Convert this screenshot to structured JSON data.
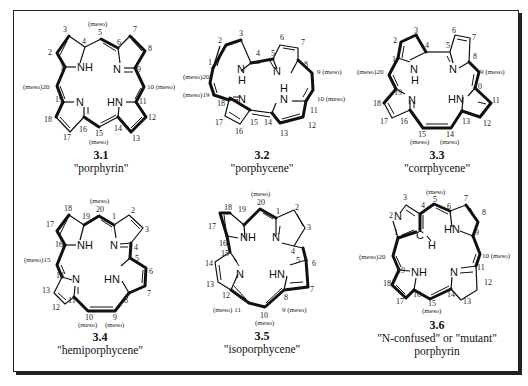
{
  "figure": {
    "compounds": [
      {
        "id": "3.1",
        "name": "\"porphyrin\"",
        "labels": {
          "c1": "1",
          "c2": "2",
          "c3": "3",
          "c4": "4",
          "c5": "5",
          "c6": "6",
          "c7": "7",
          "c8": "8",
          "c9": "9",
          "c10": "10 (meso)",
          "c11": "11",
          "c12": "12",
          "c13": "13",
          "c14": "14",
          "c15": "15",
          "c16": "16",
          "c17": "17",
          "c18": "18",
          "c19": "19",
          "c20": "(meso)20",
          "meso_top": "(meso)",
          "meso_bottom": "(meso)"
        },
        "atoms": {
          "nh1": "NH",
          "n2": "N",
          "n3": "N",
          "hn4": "HN"
        }
      },
      {
        "id": "3.2",
        "name": "\"porphycene\"",
        "labels": {
          "c1": "1",
          "c2": "2",
          "c3": "3",
          "c4": "4",
          "c5": "5",
          "c6": "6",
          "c7": "7",
          "c8": "8",
          "c9": "9 (meso)",
          "c10": "10 (meso)",
          "c11": "11",
          "c12": "12",
          "c13": "13",
          "c14": "14",
          "c15": "15",
          "c16": "16",
          "c17": "17",
          "c18": "18",
          "c19": "(meso)19",
          "c20": "(meso)20"
        },
        "atoms": {
          "nh1": "N",
          "nh1h": "H",
          "n2": "N",
          "n3": "N",
          "hn4": "N",
          "hn4h": "H"
        }
      },
      {
        "id": "3.3",
        "name": "\"corrphycene\"",
        "labels": {
          "c1": "1",
          "c2": "2",
          "c3": "3",
          "c4": "4",
          "c5": "5",
          "c6": "6",
          "c7": "7",
          "c8": "8",
          "c9": "9 (meso)",
          "c10": "10",
          "c11": "11",
          "c12": "12",
          "c13": "13",
          "c14": "14",
          "c15": "15",
          "c16": "16",
          "c17": "17",
          "c18": "18",
          "c19": "19",
          "c20": "(meso)20",
          "meso14": "(meso)",
          "meso15": "(meso)"
        },
        "atoms": {
          "nh1": "N",
          "nh1h": "H",
          "n2": "N",
          "n3": "N",
          "hn4": "HN"
        }
      },
      {
        "id": "3.4",
        "name": "\"hemiporphycene\"",
        "labels": {
          "c1": "1",
          "c2": "2",
          "c3": "3",
          "c4": "4",
          "c5": "5",
          "c6": "6",
          "c7": "7",
          "c8": "8",
          "c9": "9",
          "c10": "10",
          "c11": "11",
          "c12": "12",
          "c13": "13",
          "c14": "14",
          "c15": "(meso)15",
          "c16": "16",
          "c17": "17",
          "c18": "18",
          "c19": "19",
          "c20": "20",
          "meso20": "(meso)",
          "meso10": "(meso)",
          "meso9": "(meso)"
        },
        "atoms": {
          "nh1": "NH",
          "n2": "N",
          "n3": "N",
          "hn4": "HN"
        }
      },
      {
        "id": "3.5",
        "name": "\"isoporphycene\"",
        "labels": {
          "c1": "1",
          "c2": "2",
          "c3": "3",
          "c4": "4",
          "c5": "5",
          "c6": "6",
          "c7": "7",
          "c8": "8",
          "c9": "9 (meso)",
          "c10": "10",
          "c11": "(meso) 11",
          "c12": "12",
          "c13": "13",
          "c14": "14",
          "c15": "15",
          "c16": "16",
          "c17": "17",
          "c18": "18",
          "c19": "19",
          "c20": "20",
          "meso20": "(meso)",
          "meso10": "(meso)"
        },
        "atoms": {
          "nh1": "NH",
          "n2": "N",
          "n3": "N",
          "hn4": "HN"
        }
      },
      {
        "id": "3.6",
        "name_line1": "\"N-confused\" or \"mutant\"",
        "name_line2": "porphyrin",
        "labels": {
          "c1": "1",
          "c2": "2",
          "c3": "3",
          "c4": "4",
          "c5": "5",
          "c6": "6",
          "c7": "7",
          "c8": "8",
          "c9": "9",
          "c10": "10 (meso)",
          "c11": "11",
          "c12": "12",
          "c13": "13",
          "c14": "14",
          "c15": "15",
          "c16": "16",
          "c17": "17",
          "c18": "18",
          "c19": "19",
          "c20": "(meso)20",
          "meso5": "(meso)",
          "meso15": "(meso)"
        },
        "atoms": {
          "n2": "N",
          "ch": "C",
          "h": "H",
          "hn": "HN",
          "nh": "NH",
          "n": "N"
        }
      }
    ]
  }
}
